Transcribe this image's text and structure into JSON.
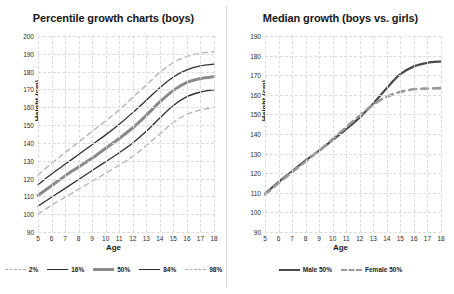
{
  "colors": {
    "outer_band": "#b0b0b0",
    "inner_band": "#2f2f2f",
    "median": "#8a8a8a",
    "male": "#4a4a4a",
    "female": "#9a9a9a",
    "grid": "#dcdcdc",
    "text": "#161616",
    "background": "#ffffff"
  },
  "chart_data": [
    {
      "type": "line",
      "title": "Percentile growth charts (boys)",
      "xlabel": "Age",
      "ylabel": "Height (cm)",
      "xlim": [
        5,
        18
      ],
      "ylim": [
        90,
        200
      ],
      "yticks": [
        90,
        100,
        110,
        120,
        130,
        140,
        150,
        160,
        170,
        180,
        190,
        200
      ],
      "xticks": [
        5,
        6,
        7,
        8,
        9,
        10,
        11,
        12,
        13,
        14,
        15,
        16,
        17,
        18
      ],
      "grid": true,
      "legend_position": "bottom",
      "x": [
        5,
        6,
        7,
        8,
        9,
        10,
        11,
        12,
        13,
        14,
        15,
        16,
        17,
        18
      ],
      "series": [
        {
          "name": "2%",
          "style": "dashed",
          "color": "#b0b0b0",
          "width": 1.3,
          "values": [
            100.0,
            105.0,
            109.5,
            114.0,
            118.5,
            123.0,
            127.5,
            132.5,
            138.5,
            145.0,
            151.5,
            156.0,
            158.5,
            160.0
          ]
        },
        {
          "name": "16%",
          "style": "solid",
          "color": "#2f2f2f",
          "width": 1.3,
          "values": [
            104.5,
            109.5,
            114.5,
            119.5,
            124.5,
            129.5,
            134.5,
            140.0,
            146.5,
            154.0,
            161.0,
            166.0,
            168.5,
            169.8
          ]
        },
        {
          "name": "50%",
          "style": "solid",
          "color": "#8a8a8a",
          "width": 3.0,
          "values": [
            110.5,
            116.0,
            121.5,
            126.5,
            131.5,
            137.0,
            142.5,
            148.5,
            155.5,
            163.0,
            169.5,
            174.0,
            176.2,
            177.2
          ]
        },
        {
          "name": "84%",
          "style": "solid",
          "color": "#2f2f2f",
          "width": 1.3,
          "values": [
            116.5,
            122.5,
            128.0,
            133.5,
            139.0,
            144.5,
            150.5,
            157.0,
            164.0,
            171.0,
            177.0,
            181.0,
            183.2,
            184.2
          ]
        },
        {
          "name": "98%",
          "style": "dashed",
          "color": "#b0b0b0",
          "width": 1.3,
          "values": [
            122.0,
            128.5,
            134.5,
            140.5,
            146.5,
            152.5,
            158.5,
            165.5,
            172.5,
            179.5,
            185.0,
            188.5,
            190.3,
            191.2
          ]
        }
      ]
    },
    {
      "type": "line",
      "title": "Median growth (boys vs. girls)",
      "xlabel": "Age",
      "ylabel": "Height (cm)",
      "xlim": [
        5,
        18
      ],
      "ylim": [
        90,
        190
      ],
      "yticks": [
        90,
        100,
        110,
        120,
        130,
        140,
        150,
        160,
        170,
        180,
        190
      ],
      "xticks": [
        5,
        6,
        7,
        8,
        9,
        10,
        11,
        12,
        13,
        14,
        15,
        16,
        17,
        18
      ],
      "grid": true,
      "legend_position": "bottom",
      "x": [
        5,
        6,
        7,
        8,
        9,
        10,
        11,
        12,
        13,
        14,
        15,
        16,
        17,
        18
      ],
      "series": [
        {
          "name": "Male 50%",
          "style": "solid",
          "color": "#4a4a4a",
          "width": 2.2,
          "values": [
            109.5,
            115.5,
            121.0,
            126.5,
            131.5,
            137.0,
            142.5,
            148.5,
            155.5,
            163.5,
            170.5,
            174.5,
            176.3,
            177.0
          ]
        },
        {
          "name": "Female 50%",
          "style": "dashed",
          "color": "#9a9a9a",
          "width": 2.6,
          "values": [
            109.0,
            115.0,
            120.5,
            126.0,
            131.5,
            137.5,
            143.5,
            149.5,
            155.0,
            159.0,
            161.5,
            162.8,
            163.2,
            163.4
          ]
        }
      ]
    }
  ]
}
